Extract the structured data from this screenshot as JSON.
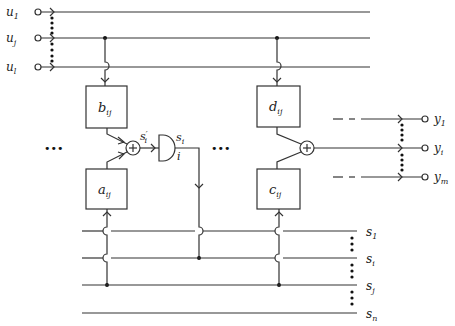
{
  "diagram": {
    "inputs": [
      {
        "name": "u",
        "sub": "1"
      },
      {
        "name": "u",
        "sub": "j"
      },
      {
        "name": "u",
        "sub": "l"
      }
    ],
    "outputs": [
      {
        "name": "y",
        "sub": "1"
      },
      {
        "name": "y",
        "sub": "i"
      },
      {
        "name": "y",
        "sub": "m"
      }
    ],
    "state_lines": [
      {
        "name": "s",
        "sub": "1"
      },
      {
        "name": "s",
        "sub": "i"
      },
      {
        "name": "s",
        "sub": "j"
      },
      {
        "name": "s",
        "sub": "n"
      }
    ],
    "blocks": {
      "b": {
        "name": "b",
        "sub": "ij"
      },
      "a": {
        "name": "a",
        "sub": "ij"
      },
      "d": {
        "name": "d",
        "sub": "ij"
      },
      "c": {
        "name": "c",
        "sub": "ij"
      }
    },
    "summer_symbol": "+",
    "gate_input_label": {
      "name": "s",
      "sup": "′",
      "sub": "i"
    },
    "gate_output_label": {
      "name": "s",
      "sub": "i"
    },
    "gate_index_label": "i",
    "ellipsis": "•••"
  }
}
